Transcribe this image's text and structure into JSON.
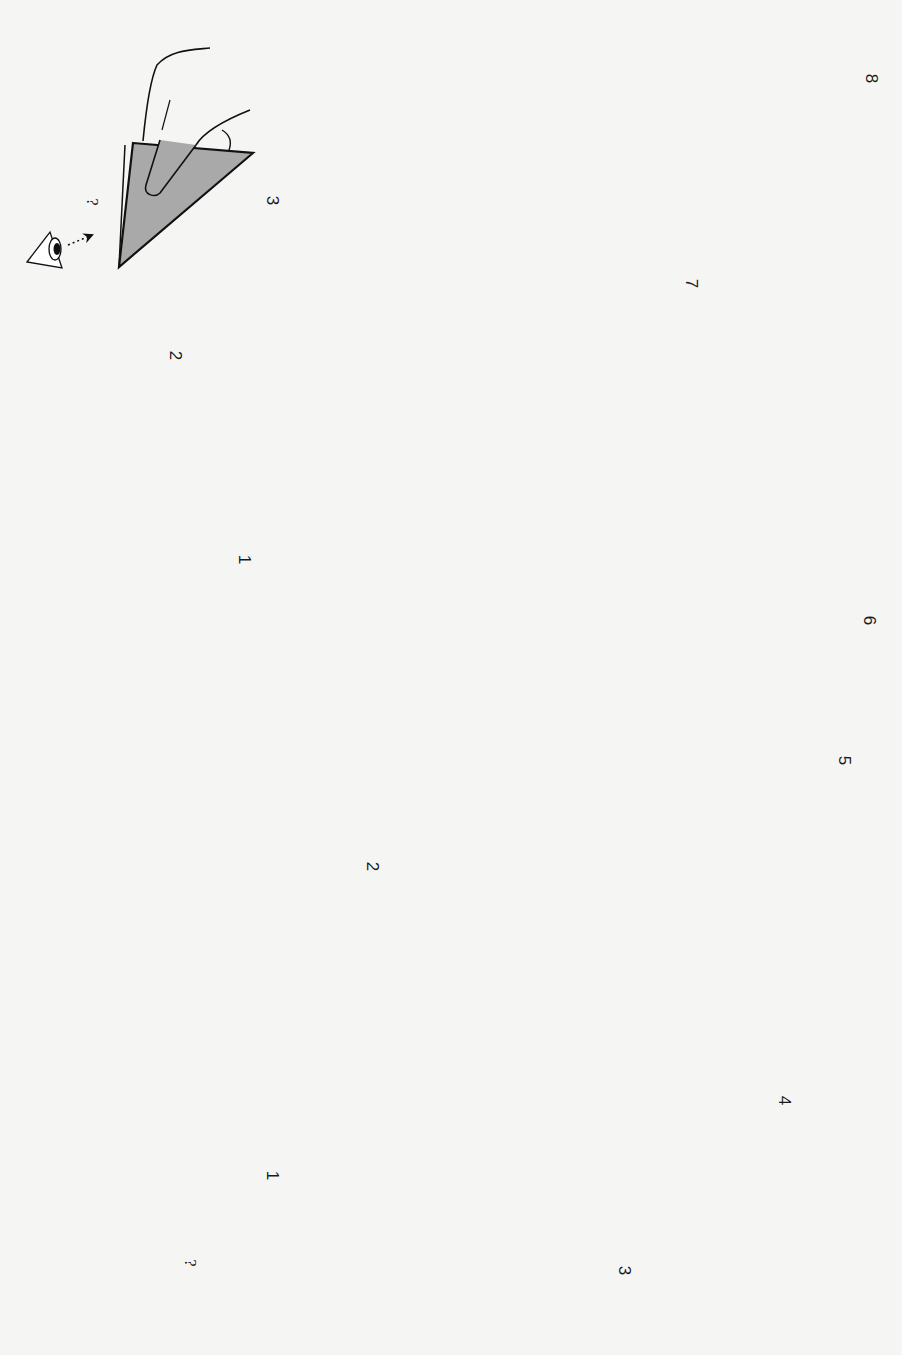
{
  "page": {
    "orientation": "rotated 90 degrees clockwise",
    "type": "origami instruction diagram",
    "colors": {
      "background": "#f5f5f3",
      "paper_fill": "#a9a9a9",
      "line": "#111111"
    }
  },
  "sequence_a": {
    "description": "Cutting a square in half and folding into a rectangle/triangle",
    "steps": [
      {
        "label": "?",
        "name": "cut-square",
        "note": "scissors cutting along dotted line"
      },
      {
        "label": "1",
        "name": "fold-up-rectangle",
        "note": "valley fold up along dashed line"
      },
      {
        "label": "2",
        "name": "crease-center",
        "note": "fold and unfold in half"
      },
      {
        "label": "3",
        "name": "fold-corner-diagonal",
        "note": "fold corner along diagonal, turn over"
      },
      {
        "label": "4",
        "name": "fold-second-corner",
        "note": "fold corner along diagonal"
      },
      {
        "label": "5",
        "name": "fold-flap",
        "note": "fold flap up"
      },
      {
        "label": "6",
        "name": "crease-triangle",
        "note": "fold and unfold, turn over"
      },
      {
        "label": "7",
        "name": "fold-over-center",
        "note": "fold over along center line"
      },
      {
        "label": "8",
        "name": "tuck-flap",
        "note": "tuck flap inside"
      }
    ]
  },
  "sequence_b": {
    "description": "Holding and manipulating the folded model",
    "steps": [
      {
        "label": "1",
        "name": "hold-model",
        "note": "hold with fingers"
      },
      {
        "label": "2",
        "name": "rotate-model",
        "note": "turn around"
      },
      {
        "label": "3",
        "name": "final-view",
        "note": "look from side, ? result"
      },
      {
        "label": "?",
        "name": "view-eye",
        "note": "eye viewing direction"
      }
    ]
  },
  "symbols": {
    "turn_over": "turn-over-icon",
    "rotate": "rotate-icon",
    "scissors": "scissors-icon",
    "eye": "eye-icon",
    "push_arrow": "hollow-curved-arrow-icon"
  }
}
